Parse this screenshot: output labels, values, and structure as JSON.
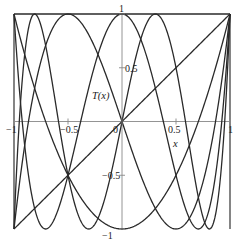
{
  "chart_data": {
    "type": "line",
    "title": "",
    "xlabel": "x",
    "ylabel": "T(x)",
    "xlim": [
      -1,
      1
    ],
    "ylim": [
      -1,
      1
    ],
    "grid": false,
    "legend": "none",
    "x_ticks": [
      {
        "value": -1,
        "label": "−1"
      },
      {
        "value": -0.5,
        "label": "−0.5"
      },
      {
        "value": 0,
        "label": "0"
      },
      {
        "value": 0.5,
        "label": "0.5"
      },
      {
        "value": 1,
        "label": "1"
      }
    ],
    "y_ticks": [
      {
        "value": 1,
        "label": "1"
      },
      {
        "value": 0.5,
        "label": "0.5"
      },
      {
        "value": -0.5,
        "label": "−0.5"
      },
      {
        "value": -1,
        "label": "−1"
      }
    ],
    "series": [
      {
        "name": "T0(x)",
        "coefficients": [
          1
        ],
        "points": [
          [
            -1,
            1
          ],
          [
            0,
            1
          ],
          [
            1,
            1
          ]
        ]
      },
      {
        "name": "T1(x)",
        "coefficients": [
          0,
          1
        ],
        "points": [
          [
            -1,
            -1
          ],
          [
            0,
            0
          ],
          [
            1,
            1
          ]
        ]
      },
      {
        "name": "T2(x)",
        "coefficients": [
          -1,
          0,
          2
        ],
        "points": [
          [
            -1,
            1
          ],
          [
            -0.5,
            -0.5
          ],
          [
            0,
            -1
          ],
          [
            0.5,
            -0.5
          ],
          [
            1,
            1
          ]
        ]
      },
      {
        "name": "T3(x)",
        "coefficients": [
          0,
          -3,
          0,
          4
        ],
        "points": [
          [
            -1,
            -1
          ],
          [
            -0.5,
            1
          ],
          [
            0,
            0
          ],
          [
            0.5,
            -1
          ],
          [
            1,
            1
          ]
        ]
      },
      {
        "name": "T4(x)",
        "coefficients": [
          1,
          0,
          -8,
          0,
          8
        ],
        "points": [
          [
            -1,
            1
          ],
          [
            -0.7071,
            -1
          ],
          [
            0,
            1
          ],
          [
            0.7071,
            -1
          ],
          [
            1,
            1
          ]
        ]
      },
      {
        "name": "T5(x)",
        "coefficients": [
          0,
          5,
          0,
          -20,
          0,
          16
        ],
        "points": [
          [
            -1,
            -1
          ],
          [
            -0.809,
            1
          ],
          [
            -0.309,
            -1
          ],
          [
            0,
            0
          ],
          [
            0.309,
            1
          ],
          [
            0.809,
            -1
          ],
          [
            1,
            1
          ]
        ]
      }
    ],
    "annotations": [
      {
        "text": "T(x)",
        "x": -0.2,
        "y": 0.25
      },
      {
        "text": "x",
        "x": 0.55,
        "y": -0.12
      }
    ]
  },
  "labels": {
    "ylabel": "T(x)",
    "xlabel": "x"
  }
}
